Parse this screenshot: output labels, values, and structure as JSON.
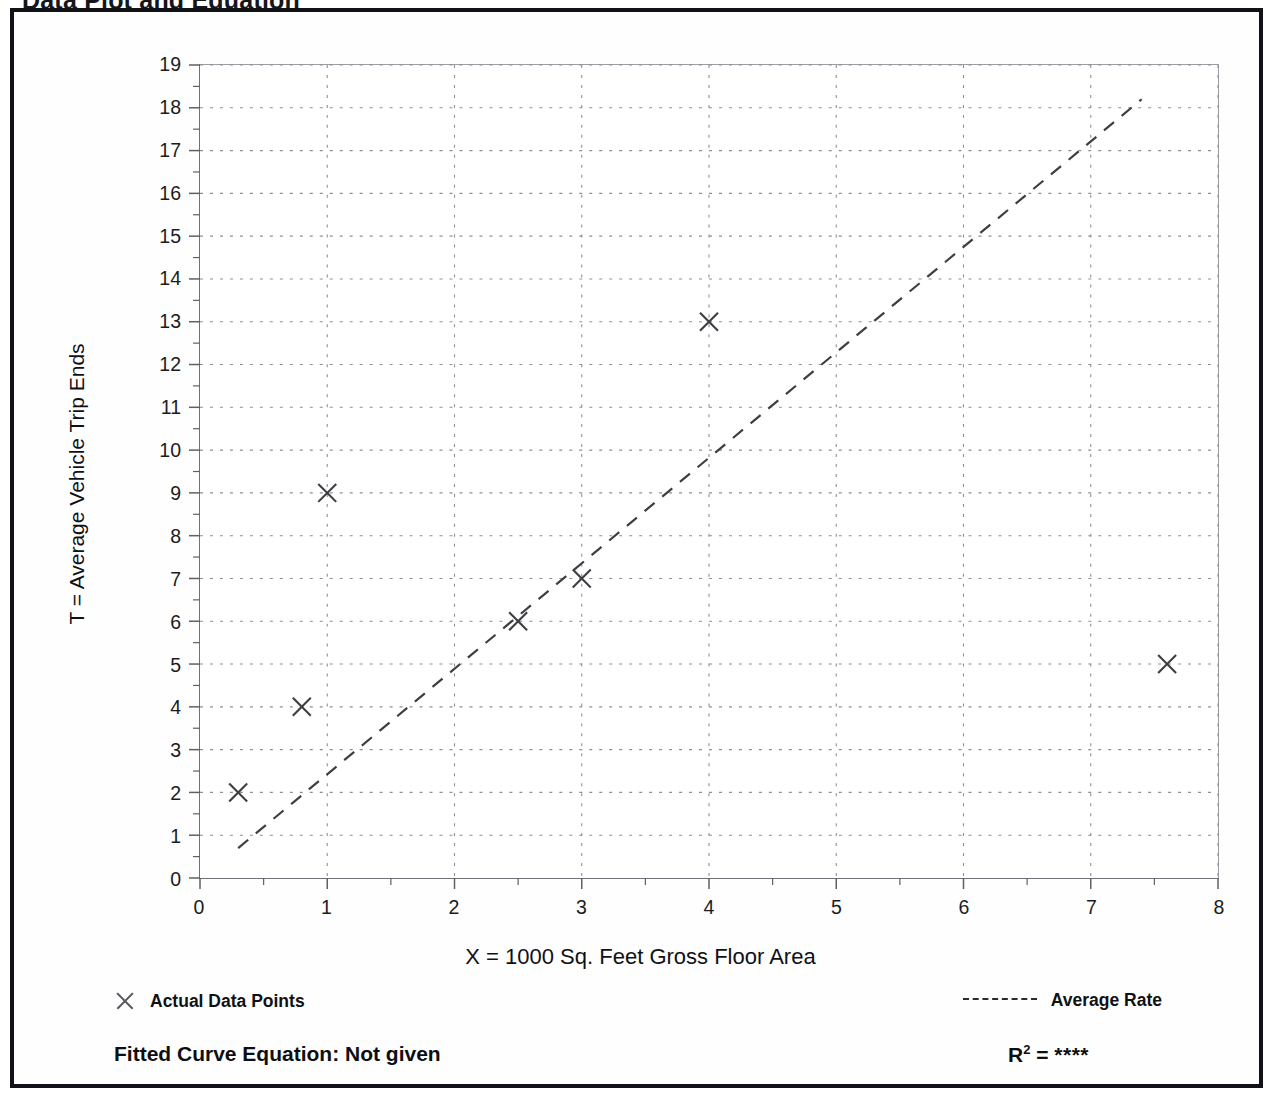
{
  "document": {
    "title": "Data Plot and Equation"
  },
  "legend": {
    "points_label": "Actual Data Points",
    "line_label": "Average Rate",
    "points_marker": "x-marker-icon",
    "line_marker": "dashed-line-icon"
  },
  "footer": {
    "equation_label": "Fitted Curve Equation:  Not given",
    "r2_prefix": "R",
    "r2_exponent": "2",
    "r2_equals": " = ",
    "r2_value": "****"
  },
  "chart_data": {
    "type": "scatter",
    "title": "Data Plot and Equation",
    "xlabel": "X = 1000 Sq. Feet Gross Floor Area",
    "ylabel": "T = Average Vehicle Trip Ends",
    "xlim": [
      0,
      8
    ],
    "ylim": [
      0,
      19
    ],
    "xticks": [
      0,
      1,
      2,
      3,
      4,
      5,
      6,
      7,
      8
    ],
    "yticks": [
      0,
      1,
      2,
      3,
      4,
      5,
      6,
      7,
      8,
      9,
      10,
      11,
      12,
      13,
      14,
      15,
      16,
      17,
      18,
      19
    ],
    "x_minor_step": 0.5,
    "y_minor_step": 0.5,
    "grid": "dotted-both-axes",
    "legend_position": "below-plot",
    "series": [
      {
        "name": "Actual Data Points",
        "type": "scatter",
        "marker": "x",
        "color": "#3c3e42",
        "points": [
          {
            "x": 0.3,
            "y": 2
          },
          {
            "x": 0.8,
            "y": 4
          },
          {
            "x": 1.0,
            "y": 9
          },
          {
            "x": 2.5,
            "y": 6
          },
          {
            "x": 3.0,
            "y": 7
          },
          {
            "x": 4.0,
            "y": 13
          },
          {
            "x": 7.6,
            "y": 5
          }
        ]
      },
      {
        "name": "Average Rate",
        "type": "line",
        "style": "dashed",
        "color": "#3c3e42",
        "endpoints": [
          {
            "x": 0.3,
            "y": 0.7
          },
          {
            "x": 7.4,
            "y": 18.2
          }
        ]
      }
    ]
  }
}
